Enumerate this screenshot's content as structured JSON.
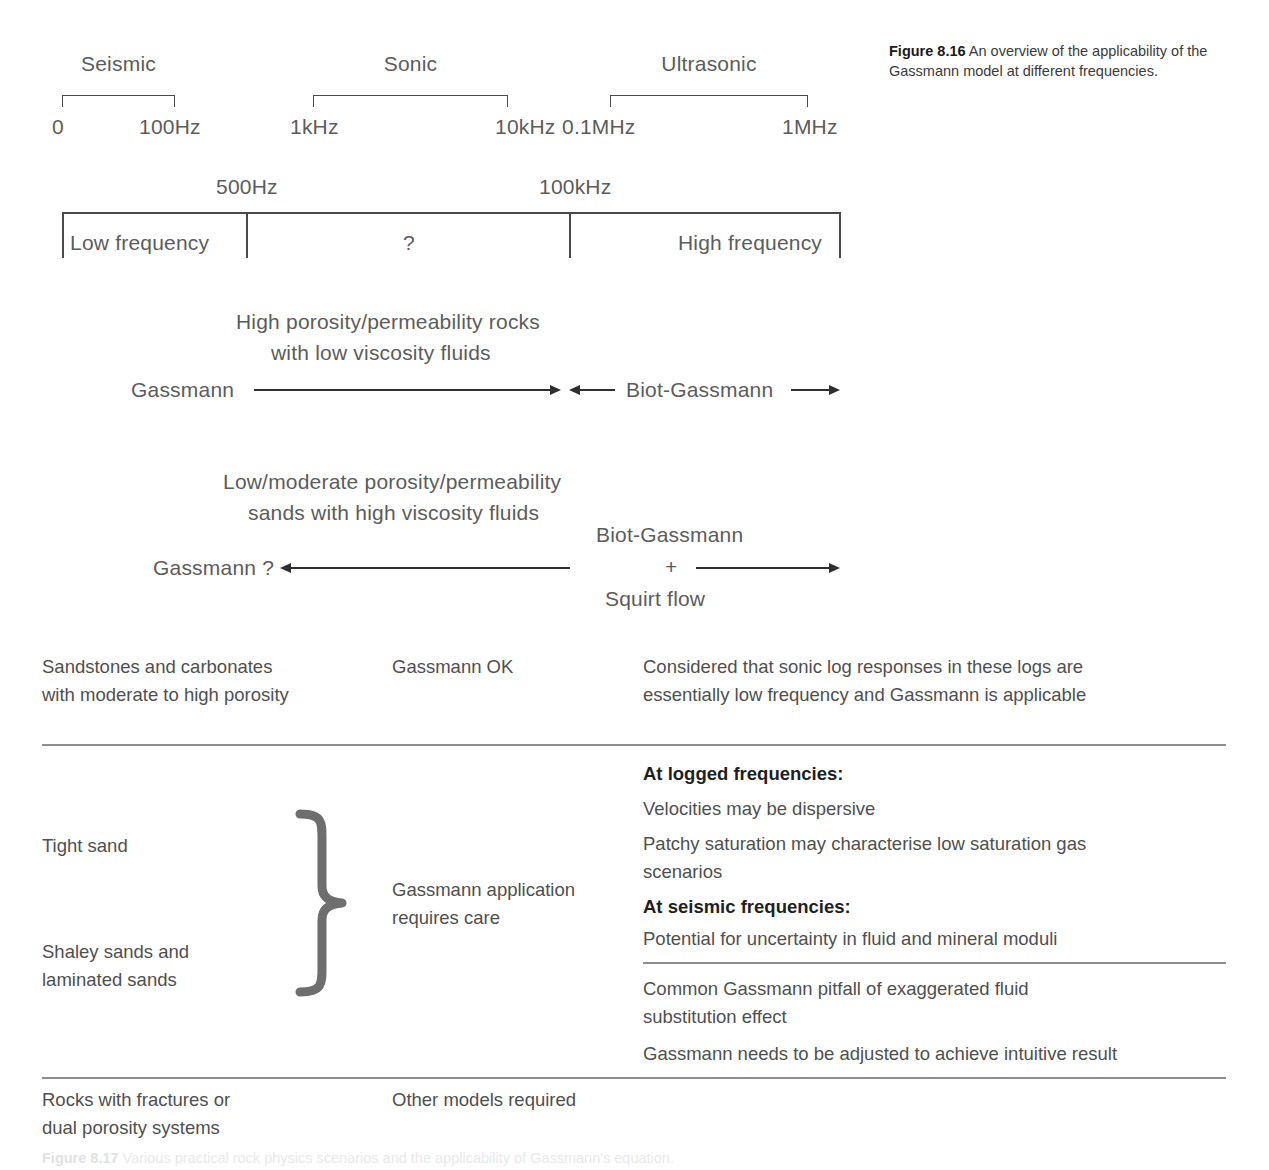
{
  "caption": {
    "number": "Figure 8.16",
    "text": "An overview of the applicability of the Gassmann model at different frequencies."
  },
  "bottom_caption": {
    "number": "Figure 8.17",
    "text": "Various practical rock physics scenarios and the applicability of Gassmann's equation."
  },
  "frequency_bands": {
    "bands": [
      {
        "name": "Seismic",
        "start_label": "0",
        "end_label": "100Hz"
      },
      {
        "name": "Sonic",
        "start_label": "1kHz",
        "end_label": "10kHz"
      },
      {
        "name": "Ultrasonic",
        "start_label": "0.1MHz",
        "end_label": "1MHz"
      }
    ]
  },
  "frequency_scale": {
    "tick_labels": [
      "500Hz",
      "100kHz"
    ],
    "regions": [
      "Low frequency",
      "?",
      "High frequency"
    ]
  },
  "model_rows": [
    {
      "condition_line1": "High porosity/permeability rocks",
      "condition_line2": "with low viscosity fluids",
      "left_label": "Gassmann",
      "right_label": "Biot-Gassmann"
    },
    {
      "condition_line1": "Low/moderate porosity/permeability",
      "condition_line2": "sands with high viscosity fluids",
      "left_label": "Gassmann ?",
      "right_label_line1": "Biot-Gassmann",
      "right_label_line2": "+",
      "right_label_line3": "Squirt flow"
    }
  ],
  "table": {
    "rows": [
      {
        "scenario": [
          "Sandstones and carbonates",
          "with moderate to high porosity"
        ],
        "verdict": [
          "Gassmann OK"
        ],
        "notes": [
          {
            "bold": false,
            "text": "Considered that sonic log responses in these logs are"
          },
          {
            "bold": false,
            "text": "essentially low frequency and Gassmann is applicable"
          }
        ]
      },
      {
        "scenario_top": [
          "Tight sand"
        ],
        "scenario_bottom": [
          "Shaley sands and",
          "laminated sands"
        ],
        "verdict": [
          "Gassmann application",
          "requires care"
        ],
        "notes_upper": [
          {
            "bold": true,
            "text": "At logged frequencies:"
          },
          {
            "bold": false,
            "text": "Velocities may be dispersive"
          },
          {
            "bold": false,
            "text": "Patchy saturation may characterise low saturation gas"
          },
          {
            "bold": false,
            "text": "scenarios"
          },
          {
            "bold": true,
            "text": "At seismic frequencies:"
          },
          {
            "bold": false,
            "text": "Potential for uncertainty in fluid and mineral moduli"
          }
        ],
        "notes_lower": [
          {
            "bold": false,
            "text": "Common Gassmann pitfall of exaggerated fluid"
          },
          {
            "bold": false,
            "text": "substitution effect"
          },
          {
            "bold": false,
            "text": "Gassmann needs to be adjusted to achieve intuitive result"
          }
        ]
      },
      {
        "scenario": [
          "Rocks with fractures or",
          "dual porosity systems"
        ],
        "verdict": [
          "Other models required"
        ],
        "notes": []
      }
    ]
  },
  "colors": {
    "text": "#5c5c5c",
    "rule": "#8e8e8e",
    "brace": "#6e6e6e",
    "arrow": "#2e2e2e"
  }
}
